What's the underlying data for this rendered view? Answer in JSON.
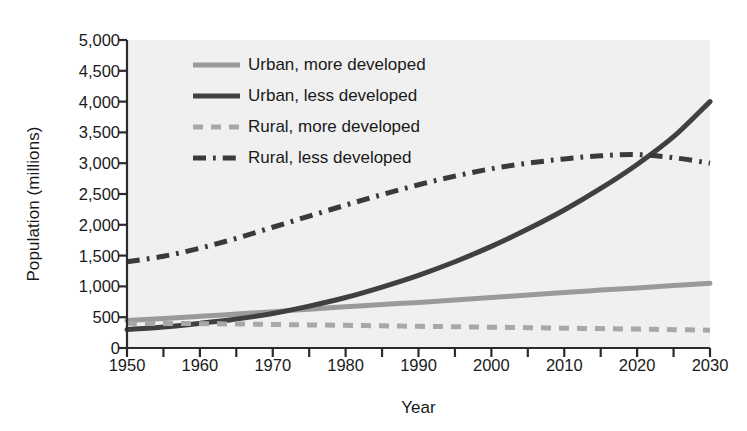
{
  "chart_data": {
    "type": "line",
    "title": "",
    "xlabel": "Year",
    "ylabel": "Population (millions)",
    "xlim": [
      1950,
      2030
    ],
    "ylim": [
      0,
      5000
    ],
    "xticks": [
      1950,
      1960,
      1970,
      1980,
      1990,
      2000,
      2010,
      2020,
      2030
    ],
    "xtick_labels": [
      "1950",
      "1960",
      "1970",
      "1980",
      "1990",
      "2000",
      "2010",
      "2020",
      "2030"
    ],
    "x_minor_tick_step": 5,
    "yticks": [
      0,
      500,
      1000,
      1500,
      2000,
      2500,
      3000,
      3500,
      4000,
      4500,
      5000
    ],
    "ytick_labels": [
      "0",
      "500",
      "1,000",
      "1,500",
      "2,000",
      "2,500",
      "3,000",
      "3,500",
      "4,000",
      "4,500",
      "5,000"
    ],
    "grid": false,
    "legend_position": "upper-left-inside",
    "plot_background": "#f0f0f0",
    "figure_background": "#ffffff",
    "axis_color": "#2b2b2b",
    "x": [
      1950,
      1955,
      1960,
      1965,
      1970,
      1975,
      1980,
      1985,
      1990,
      1995,
      2000,
      2005,
      2010,
      2015,
      2020,
      2025,
      2030
    ],
    "series": [
      {
        "name": "Urban, more developed",
        "color": "#9a9a9a",
        "style": "solid",
        "width": 5,
        "values": [
          445,
          480,
          515,
          550,
          590,
          630,
          670,
          705,
          740,
          780,
          820,
          860,
          900,
          940,
          975,
          1015,
          1050
        ]
      },
      {
        "name": "Urban, less developed",
        "color": "#404040",
        "style": "solid",
        "width": 5,
        "values": [
          300,
          340,
          400,
          470,
          560,
          680,
          820,
          990,
          1180,
          1400,
          1650,
          1930,
          2240,
          2590,
          2980,
          3430,
          4000
        ]
      },
      {
        "name": "Rural, more developed",
        "color": "#a8a8a8",
        "style": "dashed",
        "width": 5,
        "values": [
          400,
          398,
          395,
          390,
          383,
          375,
          368,
          360,
          352,
          345,
          338,
          330,
          322,
          315,
          307,
          298,
          290
        ]
      },
      {
        "name": "Rural, less developed",
        "color": "#3a3a3a",
        "style": "dashdot",
        "width": 5,
        "values": [
          1400,
          1490,
          1620,
          1780,
          1960,
          2140,
          2320,
          2490,
          2650,
          2790,
          2910,
          3000,
          3070,
          3120,
          3140,
          3090,
          3000
        ]
      }
    ]
  },
  "legend": {
    "items": [
      {
        "label": "Urban, more developed"
      },
      {
        "label": "Urban, less developed"
      },
      {
        "label": "Rural, more developed"
      },
      {
        "label": "Rural, less developed"
      }
    ]
  }
}
